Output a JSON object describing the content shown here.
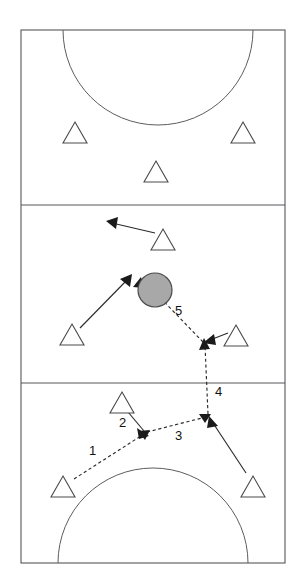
{
  "diagram": {
    "sport": "basketball-half-court-play",
    "colors": {
      "court_line": "#57575a",
      "court_background": "#ffffff",
      "player_fill": "#ffffff",
      "player_stroke": "#4a4a4d",
      "ball_fill": "#a8a8a8",
      "ball_stroke": "#4a4a4d",
      "route_stroke": "#2b2b2b",
      "label_text": "#111111"
    },
    "court": {
      "left": 21,
      "top": 30,
      "right": 285,
      "bottom": 563,
      "zone_divider_lines_y": [
        205,
        383
      ],
      "zones": [
        "top-zone",
        "middle-zone",
        "bottom-zone"
      ],
      "top_arc": {
        "center_x": 158,
        "center_y": 30,
        "radius": 95,
        "bulge": "down"
      },
      "bottom_arc": {
        "center_x": 153,
        "center_y": 563,
        "radius": 95,
        "bulge": "up"
      }
    },
    "players": [
      {
        "id": "p1",
        "label": "player-top-left",
        "x": 75,
        "y": 133,
        "zone": "top-zone"
      },
      {
        "id": "p2",
        "label": "player-top-right",
        "x": 243,
        "y": 133,
        "zone": "top-zone"
      },
      {
        "id": "p3",
        "label": "player-top-center",
        "x": 156,
        "y": 172,
        "zone": "top-zone"
      },
      {
        "id": "p4",
        "label": "player-middle-upper",
        "x": 163,
        "y": 240,
        "zone": "middle-zone"
      },
      {
        "id": "p5",
        "label": "player-middle-left",
        "x": 72,
        "y": 335,
        "zone": "middle-zone"
      },
      {
        "id": "p6",
        "label": "player-middle-right",
        "x": 236,
        "y": 336,
        "zone": "middle-zone"
      },
      {
        "id": "p7",
        "label": "player-bottom-upper",
        "x": 122,
        "y": 403,
        "zone": "bottom-zone"
      },
      {
        "id": "p8",
        "label": "player-bottom-left",
        "x": 63,
        "y": 487,
        "zone": "bottom-zone"
      },
      {
        "id": "p9",
        "label": "player-bottom-right",
        "x": 253,
        "y": 487,
        "zone": "bottom-zone"
      }
    ],
    "ball": {
      "label": "ball",
      "x": 155,
      "y": 290,
      "radius": 17
    },
    "routes": [
      {
        "number": "1",
        "type": "pass",
        "style": "dashed",
        "label_x": 89,
        "label_y": 455,
        "from": "player-bottom-left",
        "to": "pass-point-a"
      },
      {
        "number": "2",
        "type": "cut",
        "style": "solid",
        "label_x": 119,
        "label_y": 427,
        "from": "player-bottom-upper",
        "to": "pass-point-a"
      },
      {
        "number": "3",
        "type": "pass",
        "style": "dashed",
        "label_x": 175,
        "label_y": 440,
        "from": "pass-point-a",
        "to": "pass-point-b"
      },
      {
        "number": "4",
        "type": "pass",
        "style": "dashed",
        "label_x": 215,
        "label_y": 396,
        "from": "pass-point-b",
        "to": "pass-point-c"
      },
      {
        "number": "5",
        "type": "pass",
        "style": "dashed",
        "label_x": 175,
        "label_y": 315,
        "from": "pass-point-c",
        "to": "ball"
      }
    ],
    "movement_arrows": [
      {
        "id": "m1",
        "label": "top-cut-arrow",
        "from_x": 155,
        "from_y": 233,
        "to_x": 108,
        "to_y": 222
      },
      {
        "id": "m2",
        "label": "left-drive-arrow",
        "from_x": 80,
        "from_y": 328,
        "to_x": 128,
        "to_y": 276
      },
      {
        "id": "m3",
        "label": "right-close-out-arrow",
        "from_x": 228,
        "from_y": 333,
        "to_x": 204,
        "to_y": 342
      },
      {
        "id": "m4",
        "label": "bottom-right-cut-arrow",
        "from_x": 246,
        "from_y": 473,
        "to_x": 209,
        "to_y": 420
      },
      {
        "id": "m5",
        "label": "bottom-upper-cut-arrow",
        "from_x": 128,
        "from_y": 412,
        "to_x": 146,
        "to_y": 433
      }
    ]
  }
}
